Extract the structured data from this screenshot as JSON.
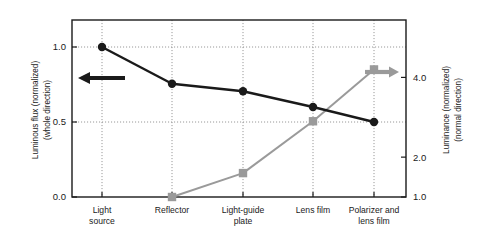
{
  "chart_data": {
    "type": "line",
    "title": "",
    "xlabel": "",
    "categories": [
      "Light source",
      "Reflector",
      "Light-guide plate",
      "Lens film",
      "Polarizer and lens film"
    ],
    "categories_lines": [
      [
        "Light",
        "source"
      ],
      [
        "Reflector",
        ""
      ],
      [
        "Light-guide",
        "plate"
      ],
      [
        "Lens film",
        ""
      ],
      [
        "Polarizer and",
        "lens film"
      ]
    ],
    "grid": true,
    "legend": "none",
    "series": [
      {
        "name": "Luminous flux (normalized) (whole direction)",
        "axis": "left",
        "marker": "circle",
        "color": "#1a1a1a",
        "values": [
          1.0,
          0.755,
          0.705,
          0.6,
          0.5
        ]
      },
      {
        "name": "Luminance (normalized) (normal direction)",
        "axis": "right",
        "marker": "square",
        "color": "#9a9a9a",
        "values": [
          null,
          1.0,
          1.6,
          2.9,
          4.2
        ]
      }
    ],
    "left_axis": {
      "label_line1": "Luminous flux (normalized)",
      "label_line2": "(whole direction)",
      "ticks": [
        "0.0",
        "0.5",
        "1.0"
      ],
      "tick_values": [
        0.0,
        0.5,
        1.0
      ],
      "ylim": [
        0.0,
        1.18
      ],
      "color": "#1a1a1a"
    },
    "right_axis": {
      "label_line1": "Luminance (normalized)",
      "label_line2": "(normal direction)",
      "ticks": [
        "1.0",
        "2.0",
        "4.0"
      ],
      "tick_values": [
        1.0,
        2.0,
        4.0
      ],
      "ylim": [
        1.0,
        5.44
      ],
      "color": "#1a1a1a"
    },
    "annotations": [
      {
        "name": "left-axis-arrow",
        "direction": "left",
        "color": "#1a1a1a"
      },
      {
        "name": "right-axis-arrow",
        "direction": "right",
        "color": "#9a9a9a"
      }
    ]
  }
}
